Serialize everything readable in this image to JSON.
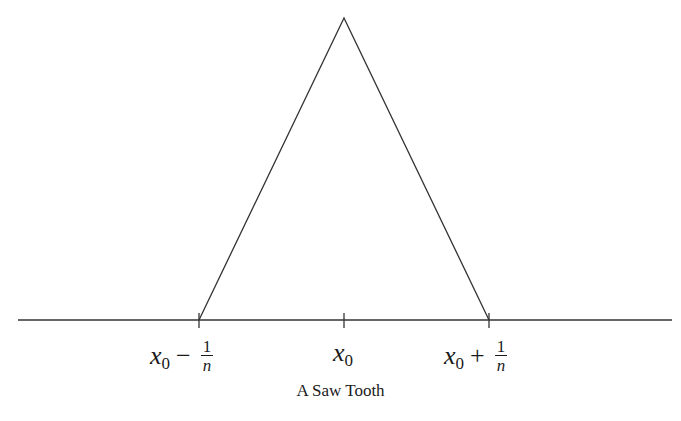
{
  "figure": {
    "caption": "A Saw Tooth",
    "axis": {
      "x_start": 18,
      "x_end": 672,
      "y": 320
    },
    "curve": {
      "type": "triangle",
      "points": [
        [
          199,
          320
        ],
        [
          344,
          18
        ],
        [
          489,
          320
        ]
      ]
    },
    "ticks": [
      {
        "x": 199,
        "label_var": "x",
        "label_sub": "0",
        "label_op": "−",
        "label_num": "1",
        "label_den": "n"
      },
      {
        "x": 344,
        "label_var": "x",
        "label_sub": "0"
      },
      {
        "x": 489,
        "label_var": "x",
        "label_sub": "0",
        "label_op": "+",
        "label_num": "1",
        "label_den": "n"
      }
    ],
    "stroke_color": "#333333"
  }
}
